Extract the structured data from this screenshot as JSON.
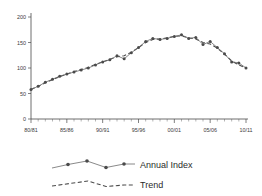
{
  "chart_data": {
    "type": "line",
    "title": "",
    "xlabel": "",
    "ylabel": "",
    "ylim": [
      0,
      200
    ],
    "yticks": [
      0,
      50,
      100,
      150,
      200
    ],
    "ytick_labels": [
      "0",
      "50",
      "100",
      "150",
      "200"
    ],
    "grid": false,
    "legend_position": "bottom",
    "x": [
      "80/81",
      "81/82",
      "82/83",
      "83/84",
      "84/85",
      "85/86",
      "86/87",
      "87/88",
      "88/89",
      "89/90",
      "90/91",
      "91/92",
      "92/93",
      "93/94",
      "94/95",
      "95/96",
      "96/97",
      "97/98",
      "98/99",
      "99/00",
      "00/01",
      "01/02",
      "02/03",
      "03/04",
      "04/05",
      "05/06",
      "06/07",
      "07/08",
      "08/09",
      "09/10",
      "10/11"
    ],
    "xtick_labels": [
      "80/81",
      "85/86",
      "90/91",
      "95/96",
      "00/01",
      "05/06",
      "10/11"
    ],
    "xtick_positions": [
      0,
      5,
      10,
      15,
      20,
      25,
      30
    ],
    "series": [
      {
        "name": "Annual Index",
        "style": "solid-with-markers",
        "color": "#6b6b6b",
        "values": [
          58,
          64,
          72,
          78,
          84,
          88,
          92,
          96,
          100,
          106,
          112,
          116,
          124,
          118,
          130,
          140,
          152,
          158,
          156,
          158,
          162,
          165,
          158,
          160,
          146,
          152,
          140,
          128,
          112,
          110,
          100
        ]
      },
      {
        "name": "Trend",
        "style": "dashed",
        "color": "#4a4a4a",
        "values": [
          58,
          64,
          71,
          77,
          83,
          88,
          93,
          97,
          101,
          107,
          112,
          117,
          122,
          124,
          131,
          140,
          150,
          156,
          157,
          159,
          162,
          163,
          159,
          157,
          150,
          147,
          139,
          127,
          114,
          106,
          100
        ]
      }
    ]
  },
  "legend": {
    "entries": [
      {
        "label": "Annual Index",
        "marker": "line-dots"
      },
      {
        "label": "Trend",
        "marker": "dashed-line"
      }
    ]
  }
}
